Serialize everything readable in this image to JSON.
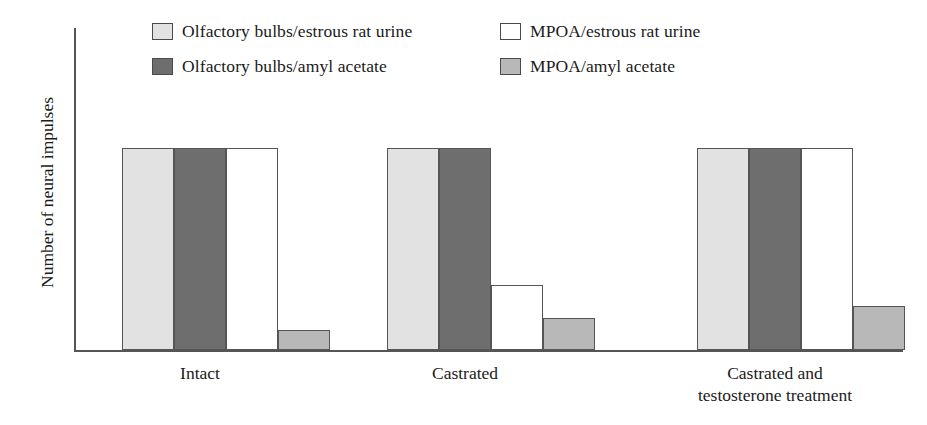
{
  "figure": {
    "width": 927,
    "height": 425
  },
  "chart_data": {
    "type": "bar",
    "title": "",
    "subtitle": "",
    "xlabel": "",
    "ylabel": "Number of neural impulses",
    "categories": [
      "Intact",
      "Castrated",
      "Castrated and\ntestosterone treatment"
    ],
    "category_lines": [
      [
        "Intact"
      ],
      [
        "Castrated"
      ],
      [
        "Castrated and",
        "testosterone treatment"
      ]
    ],
    "series": [
      {
        "name": "Olfactory bulbs/estrous rat urine",
        "color": "#e2e2e2",
        "values": [
          100,
          100,
          100
        ]
      },
      {
        "name": "Olfactory bulbs/amyl acetate",
        "color": "#6e6e6e",
        "values": [
          100,
          100,
          100
        ]
      },
      {
        "name": "MPOA/estrous rat urine",
        "color": "#ffffff",
        "values": [
          100,
          32,
          100
        ]
      },
      {
        "name": "MPOA/amyl acetate",
        "color": "#b8b8b8",
        "values": [
          10,
          16,
          22
        ]
      }
    ],
    "ylim": [
      0,
      100
    ],
    "yticks": [],
    "ytick_labels": [],
    "grid": false,
    "legend_position": "top",
    "axis_color": "#555555",
    "bar_border_color": "#555555"
  },
  "legend": {
    "entries": [
      {
        "label": "Olfactory bulbs/estrous rat urine",
        "color": "#e2e2e2",
        "row": 0,
        "col": 0
      },
      {
        "label": "Olfactory bulbs/amyl acetate",
        "color": "#6e6e6e",
        "row": 1,
        "col": 0
      },
      {
        "label": "MPOA/estrous rat urine",
        "color": "#ffffff",
        "row": 0,
        "col": 1
      },
      {
        "label": "MPOA/amyl acetate",
        "color": "#b8b8b8",
        "row": 1,
        "col": 1
      }
    ]
  }
}
